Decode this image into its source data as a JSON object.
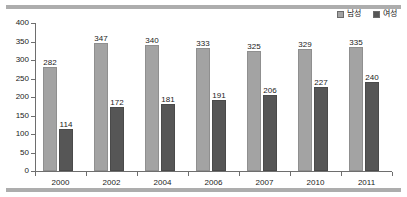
{
  "chart_data": {
    "type": "bar",
    "title": "",
    "subtitle": "",
    "xlabel": "",
    "ylabel": "",
    "categories": [
      "2000",
      "2002",
      "2004",
      "2006",
      "2007",
      "2010",
      "2011"
    ],
    "series": [
      {
        "name": "남성",
        "color": "#a3a3a3",
        "values": [
          282,
          347,
          340,
          333,
          325,
          329,
          335
        ]
      },
      {
        "name": "여성",
        "color": "#565656",
        "values": [
          114,
          172,
          181,
          191,
          206,
          227,
          240
        ]
      }
    ],
    "ylim": [
      0,
      400
    ],
    "ytick_values": [
      0,
      50,
      100,
      150,
      200,
      250,
      300,
      350,
      400
    ],
    "ytick_labels": [
      "0",
      "50",
      "100",
      "150",
      "200",
      "250",
      "300",
      "350",
      "400"
    ],
    "grid": false,
    "legend_position": "top-right",
    "data_labels_shown": true
  },
  "legend": {
    "entries": [
      {
        "label": "남성",
        "swatch": "legend-swatch-male"
      },
      {
        "label": "여성",
        "swatch": "legend-swatch-female"
      }
    ]
  },
  "decorations": {
    "top_rule": "",
    "bottom_rule": ""
  }
}
